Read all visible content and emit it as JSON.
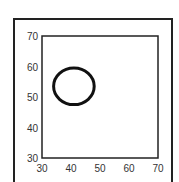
{
  "chart_data": {
    "type": "line",
    "title": "",
    "xlabel": "",
    "ylabel": "",
    "xlim": [
      30,
      70
    ],
    "ylim": [
      30,
      70
    ],
    "xticks": [
      30,
      40,
      50,
      60,
      70
    ],
    "yticks": [
      30,
      40,
      50,
      60,
      70
    ],
    "grid": false,
    "series": [
      {
        "name": "closed contour",
        "shape": "ellipse",
        "center": [
          41,
          53.5
        ],
        "radius_x": 7,
        "radius_y": 6,
        "color": "#111111"
      }
    ]
  },
  "axes": {
    "x_tick_labels": [
      "30",
      "40",
      "50",
      "60",
      "70"
    ],
    "y_tick_labels": [
      "70",
      "60",
      "50",
      "40",
      "30"
    ]
  }
}
